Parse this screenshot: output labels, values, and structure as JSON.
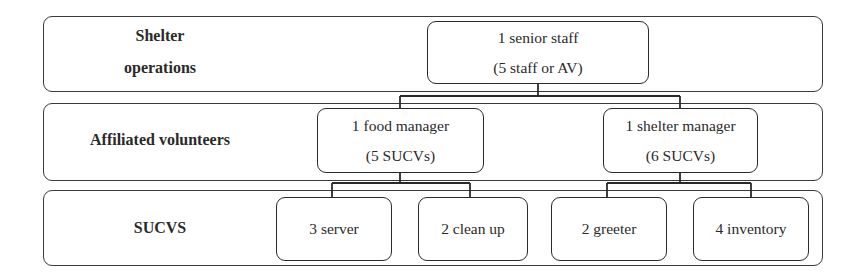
{
  "diagram": {
    "type": "org-chart",
    "bands": [
      {
        "label_lines": [
          "Shelter",
          "operations"
        ]
      },
      {
        "label_lines": [
          "Affiliated volunteers"
        ]
      },
      {
        "label_lines": [
          "SUCVS"
        ]
      }
    ],
    "nodes": {
      "senior_staff": {
        "line1": "1 senior staff",
        "line2": "(5 staff or AV)"
      },
      "food_manager": {
        "line1": "1 food manager",
        "line2": "(5 SUCVs)"
      },
      "shelter_manager": {
        "line1": "1 shelter manager",
        "line2": "(6 SUCVs)"
      },
      "server": {
        "line1": "3 server"
      },
      "clean_up": {
        "line1": "2 clean up"
      },
      "greeter": {
        "line1": "2 greeter"
      },
      "inventory": {
        "line1": "4 inventory"
      }
    },
    "edges": [
      [
        "senior_staff",
        "food_manager"
      ],
      [
        "senior_staff",
        "shelter_manager"
      ],
      [
        "food_manager",
        "server"
      ],
      [
        "food_manager",
        "clean_up"
      ],
      [
        "shelter_manager",
        "greeter"
      ],
      [
        "shelter_manager",
        "inventory"
      ]
    ]
  }
}
